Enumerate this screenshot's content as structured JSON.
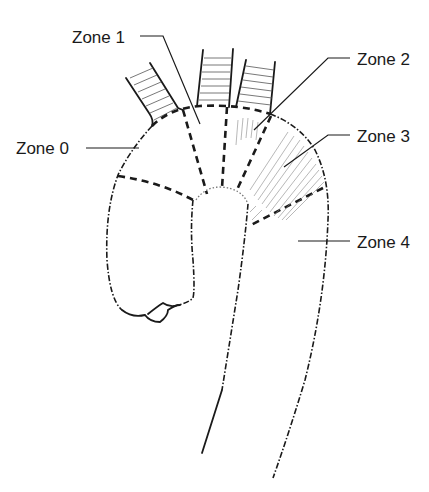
{
  "figure": {
    "background": "#ffffff",
    "line_color": "#1a1a1a"
  },
  "labels": [
    {
      "id": "zone1",
      "text": "Zone 1",
      "x": 72,
      "y": 43
    },
    {
      "id": "zone2",
      "text": "Zone 2",
      "x": 357,
      "y": 65
    },
    {
      "id": "zone0",
      "text": "Zone 0",
      "x": 16,
      "y": 154
    },
    {
      "id": "zone3",
      "text": "Zone 3",
      "x": 357,
      "y": 142
    },
    {
      "id": "zone4",
      "text": "Zone 4",
      "x": 357,
      "y": 248
    }
  ],
  "leaders": [
    {
      "id": "zone1-leader",
      "d": "M140,36 L163,36 L200,124"
    },
    {
      "id": "zone2-leader",
      "d": "M350,58 L328,58 L254,130"
    },
    {
      "id": "zone0-leader",
      "d": "M86,148 L139,148"
    },
    {
      "id": "zone3-leader",
      "d": "M350,135 L328,135 L284,167"
    },
    {
      "id": "zone4-leader",
      "d": "M350,241 L298,241"
    }
  ],
  "zones": [
    "Zone 0",
    "Zone 1",
    "Zone 2",
    "Zone 3",
    "Zone 4"
  ]
}
